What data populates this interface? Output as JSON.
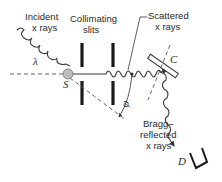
{
  "diagram": {
    "labels": {
      "incident_line1": "Incident",
      "incident_line2": "x rays",
      "wavelength": "λ",
      "source": "S",
      "slits_line1": "Collimating",
      "slits_line2": "slits",
      "scattered_line1": "Scattered",
      "scattered_line2": "x rays",
      "crystal": "C",
      "angle": "φ",
      "bragg_line1": "Bragg–",
      "bragg_line2": "reflected",
      "bragg_line3": "x rays",
      "detector": "D"
    },
    "colors": {
      "ink": "#2a2a2a",
      "source_fill": "#bdbdbd"
    }
  }
}
